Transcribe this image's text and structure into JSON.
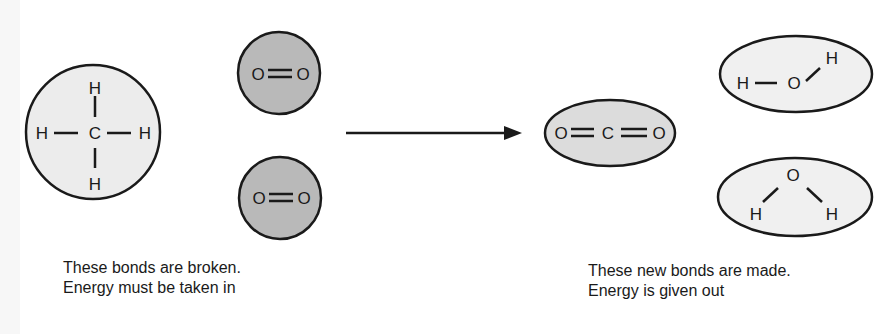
{
  "diagram": {
    "type": "chemical-reaction-bond-energy",
    "reactants": {
      "methane": {
        "name": "methane (CH4)",
        "atoms": {
          "center": "C",
          "top": "H",
          "bottom": "H",
          "left": "H",
          "right": "H"
        },
        "fill": "#ececec"
      },
      "oxygen_1": {
        "name": "oxygen (O2)",
        "left": "O",
        "right": "O",
        "bond": "double",
        "fill": "#b9b9b9"
      },
      "oxygen_2": {
        "name": "oxygen (O2)",
        "left": "O",
        "right": "O",
        "bond": "double",
        "fill": "#b9b9b9"
      }
    },
    "arrow": {
      "direction": "right",
      "meaning": "reacts to form"
    },
    "products": {
      "carbon_dioxide": {
        "name": "carbon dioxide (CO2)",
        "left": "O",
        "center": "C",
        "right": "O",
        "bond": "double",
        "fill": "#dcdcdc"
      },
      "water_1": {
        "name": "water (H2O)",
        "left_h": "H",
        "o": "O",
        "right_h": "H",
        "fill": "#f0f0f0"
      },
      "water_2": {
        "name": "water (H2O)",
        "o": "O",
        "left_h": "H",
        "right_h": "H",
        "fill": "#f0f0f0"
      }
    },
    "captions": {
      "left": {
        "line1": "These bonds are broken.",
        "line2": "Energy must be taken in"
      },
      "right": {
        "line1": "These new bonds are made.",
        "line2": "Energy is given out"
      }
    },
    "colors": {
      "stroke": "#1a1a1a",
      "text": "#1a1a1a",
      "background": "#ffffff"
    }
  }
}
